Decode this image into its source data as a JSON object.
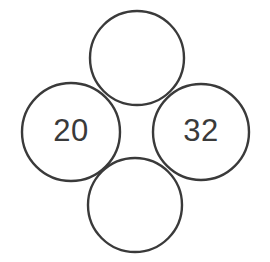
{
  "figure": {
    "background_color": "#ffffff",
    "stroke_color": "#3a3a3a",
    "text_color": "#3a3a3a",
    "stroke_width": 2.4
  },
  "chart_data": {
    "type": "diagram",
    "title": "",
    "xlabel": "",
    "ylabel": "",
    "layout": "diamond",
    "grid": false,
    "legend": null,
    "categories": [
      "top",
      "left",
      "right",
      "bottom"
    ],
    "values": [
      null,
      20,
      32,
      null
    ],
    "nodes": [
      {
        "id": "top",
        "label": "",
        "value": null,
        "cx": 137,
        "cy": 58,
        "r": 47,
        "filled": false
      },
      {
        "id": "left",
        "label": "20",
        "value": 20,
        "cx": 71,
        "cy": 132,
        "r": 49,
        "filled": true
      },
      {
        "id": "right",
        "label": "32",
        "value": 32,
        "cx": 201,
        "cy": 132,
        "r": 48,
        "filled": true
      },
      {
        "id": "bottom",
        "label": "",
        "value": null,
        "cx": 135,
        "cy": 205,
        "r": 47,
        "filled": false
      }
    ]
  },
  "nodes": {
    "top": {
      "label": ""
    },
    "left": {
      "label": "20"
    },
    "right": {
      "label": "32"
    },
    "bottom": {
      "label": ""
    }
  }
}
